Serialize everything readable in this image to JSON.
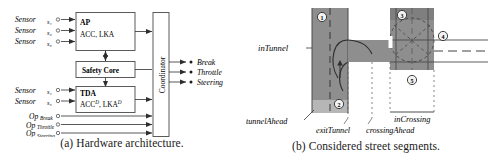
{
  "figure": {
    "panel_a": {
      "caption": "(a) Hardware architecture.",
      "inputs_top": [
        {
          "name": "Sensor",
          "sub": "s₁"
        },
        {
          "name": "Sensor",
          "sub": "s₂"
        },
        {
          "name": "Sensor",
          "sub": "s₃"
        }
      ],
      "inputs_mid": [
        {
          "name": "Sensor",
          "sub": "s₄"
        },
        {
          "name": "Sensor",
          "sub": "s₅"
        }
      ],
      "inputs_bottom": [
        {
          "name": "Op",
          "sub": "Break"
        },
        {
          "name": "Op",
          "sub": "Throttle"
        },
        {
          "name": "Op",
          "sub": "Steering"
        }
      ],
      "boxes": {
        "ap_title": "AP",
        "ap_body": "ACC, LKA",
        "safety_core": "Safety Core",
        "tda_title": "TDA",
        "tda_body_1": "ACC",
        "tda_sup_1": "D",
        "tda_body_2": ", LKA",
        "tda_sup_2": "D",
        "coordinator": "Coordinator"
      },
      "outputs": [
        "Break",
        "Throttle",
        "Steering"
      ]
    },
    "panel_b": {
      "caption": "(b) Considered street segments.",
      "labels": {
        "in_tunnel": "inTunnel",
        "tunnel_ahead": "tunnelAhead",
        "exit_tunnel": "exitTunnel",
        "crossing_ahead": "crossingAhead",
        "in_crossing": "inCrossing"
      },
      "markers": [
        "1",
        "2",
        "3",
        "4",
        "5"
      ]
    }
  },
  "colors": {
    "road_fill": "#8e8e8e",
    "road_fill_light": "#b4b4b4",
    "line": "#3a3a3a",
    "box_border": "#4a4a4a",
    "text": "#1c1c1c"
  }
}
